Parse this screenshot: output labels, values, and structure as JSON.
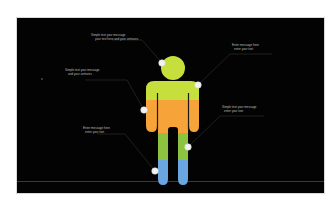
{
  "infographic": {
    "title": "Human figure infographic",
    "background_color": "#030303",
    "figure": {
      "segments": [
        {
          "name": "head-and-chest",
          "color": "#c6df3c"
        },
        {
          "name": "torso-and-arms",
          "color": "#f6a43a"
        },
        {
          "name": "upper-legs",
          "color": "#8cc440"
        },
        {
          "name": "lower-legs",
          "color": "#6aa7e0"
        }
      ]
    },
    "callouts": [
      {
        "id": "head",
        "lines": [
          "Simple text your message",
          "your text here and your ventures"
        ]
      },
      {
        "id": "shoulder",
        "lines": [
          "Enter message here",
          "enter your text"
        ]
      },
      {
        "id": "arm",
        "lines": [
          "Simple text your message",
          "and your ventures"
        ]
      },
      {
        "id": "knee",
        "lines": [
          "Simple text your message",
          "enter your text"
        ]
      },
      {
        "id": "foot",
        "lines": [
          "Enter message here",
          "enter your text"
        ]
      }
    ]
  }
}
